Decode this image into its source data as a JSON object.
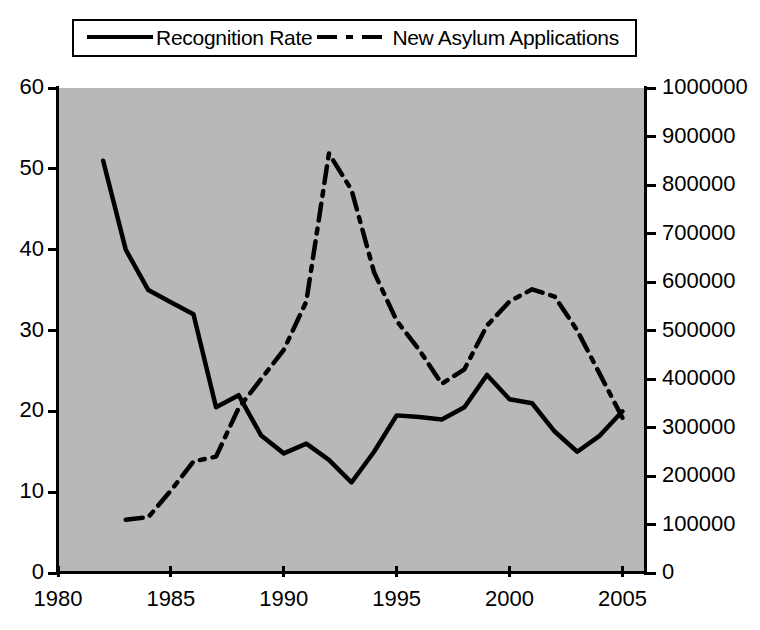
{
  "legend": {
    "position": "top-center",
    "entries": [
      {
        "label": "Recognition Rate",
        "style": "solid",
        "icon": "solid-line-icon"
      },
      {
        "label": "New Asylum Applications",
        "style": "dash-dot",
        "icon": "dash-dot-line-icon"
      }
    ]
  },
  "chart_data": {
    "type": "line",
    "title": "",
    "xlabel": "",
    "grid": false,
    "legend_position": "top-center",
    "plot_background": "#b8b8b8",
    "line_color": "#000000",
    "xlim": [
      1980,
      2006
    ],
    "xticks": [
      1980,
      1985,
      1990,
      1995,
      2000,
      2005
    ],
    "xticklabels": [
      "1980",
      "1985",
      "1990",
      "1995",
      "2000",
      "2005"
    ],
    "axes": [
      {
        "id": "left",
        "ylabel": "Recognition Rate",
        "ylim": [
          0,
          60
        ],
        "yticks": [
          0,
          10,
          20,
          30,
          40,
          50,
          60
        ],
        "yticklabels": [
          "0",
          "10",
          "20",
          "30",
          "40",
          "50",
          "60"
        ]
      },
      {
        "id": "right",
        "ylabel": "New Asylum Applications",
        "ylim": [
          0,
          1000000
        ],
        "yticks": [
          0,
          100000,
          200000,
          300000,
          400000,
          500000,
          600000,
          700000,
          800000,
          900000,
          1000000
        ],
        "yticklabels": [
          "0",
          "100000",
          "200000",
          "300000",
          "400000",
          "500000",
          "600000",
          "700000",
          "800000",
          "900000",
          "1000000"
        ]
      }
    ],
    "series": [
      {
        "name": "Recognition Rate",
        "axis": "left",
        "style": "solid",
        "x": [
          1982,
          1983,
          1984,
          1985,
          1986,
          1987,
          1988,
          1989,
          1990,
          1991,
          1992,
          1993,
          1994,
          1995,
          1996,
          1997,
          1998,
          1999,
          2000,
          2001,
          2002,
          2003,
          2004,
          2005
        ],
        "values": [
          51,
          40,
          35,
          33.5,
          32,
          20.5,
          22,
          17,
          14.8,
          16,
          14,
          11.2,
          15,
          19.5,
          19.3,
          19,
          20.5,
          24.5,
          21.5,
          21,
          17.5,
          15,
          17,
          20
        ]
      },
      {
        "name": "New Asylum Applications",
        "axis": "right",
        "style": "dash-dot",
        "x": [
          1983,
          1984,
          1985,
          1986,
          1987,
          1988,
          1989,
          1990,
          1991,
          1992,
          1993,
          1994,
          1995,
          1996,
          1997,
          1998,
          1999,
          2000,
          2001,
          2002,
          2003,
          2004,
          2005
        ],
        "values": [
          110000,
          115000,
          170000,
          230000,
          240000,
          340000,
          400000,
          460000,
          560000,
          865000,
          790000,
          620000,
          520000,
          460000,
          390000,
          420000,
          510000,
          560000,
          585000,
          570000,
          500000,
          410000,
          320000
        ]
      }
    ]
  }
}
